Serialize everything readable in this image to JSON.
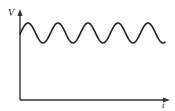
{
  "diagram": {
    "type": "waveform-sketch",
    "axes": {
      "y_label": "V",
      "x_label": "t"
    },
    "colors": {
      "line": "#222222",
      "axis": "#333333",
      "background": "#ffffff"
    }
  },
  "chart_data": {
    "type": "line",
    "title": "",
    "xlabel": "t",
    "ylabel": "V",
    "grid": false,
    "cycles_shown": 5,
    "series": [
      {
        "name": "V(t)",
        "shape": "sine",
        "offset_relative": 0.75,
        "amplitude_relative": 0.11
      }
    ]
  }
}
